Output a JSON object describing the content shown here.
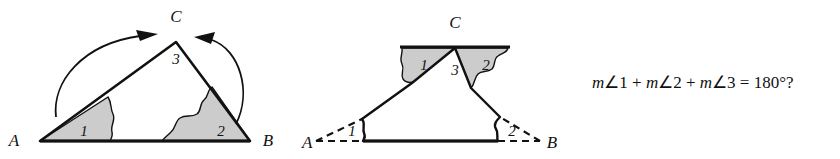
{
  "figure": {
    "kind": "geometry-diagram",
    "topic": "triangle-angle-sum",
    "background_color": "#ffffff",
    "ink_color": "#111111",
    "shade_color": "#cccccc"
  },
  "figure_left": {
    "name": "triangle-with-rotation-arrows",
    "vertices": [
      {
        "id": "A",
        "label": "A"
      },
      {
        "id": "B",
        "label": "B"
      },
      {
        "id": "C",
        "label": "C"
      }
    ],
    "angles": [
      {
        "id": "1",
        "label": "1",
        "at": "A",
        "shaded": true
      },
      {
        "id": "2",
        "label": "2",
        "at": "B",
        "shaded": true
      },
      {
        "id": "3",
        "label": "3",
        "at": "C",
        "shaded": false
      }
    ],
    "arrows": [
      {
        "id": "arrow-left",
        "from": "A",
        "to": "C",
        "direction": "clockwise"
      },
      {
        "id": "arrow-right",
        "from": "B",
        "to": "C",
        "direction": "counterclockwise"
      }
    ]
  },
  "figure_right": {
    "name": "triangle-angles-rearranged-at-vertex",
    "vertices": [
      {
        "id": "A",
        "label": "A"
      },
      {
        "id": "B",
        "label": "B"
      },
      {
        "id": "C",
        "label": "C"
      }
    ],
    "angles_moved": [
      {
        "id": "1",
        "label": "1",
        "shaded": true,
        "position": "left-of-angle-3"
      },
      {
        "id": "2",
        "label": "2",
        "shaded": true,
        "position": "right-of-angle-3"
      }
    ],
    "angles_original": [
      {
        "id": "1",
        "label": "1",
        "at": "A",
        "shaded": false
      },
      {
        "id": "2",
        "label": "2",
        "at": "B",
        "shaded": false
      }
    ],
    "angles_fixed": [
      {
        "id": "3",
        "label": "3",
        "at": "C",
        "shaded": false
      }
    ],
    "straight_line_at_C": true,
    "dashed_edges": [
      "A-corner",
      "B-corner",
      "base-A",
      "base-B"
    ]
  },
  "equation": {
    "m1": "m",
    "angle_symbol": "∠",
    "term1": "1",
    "plus1": "+",
    "m2": "m",
    "term2": "2",
    "plus2": "+",
    "m3": "m",
    "term3": "3",
    "equals": "=",
    "result": "180°?",
    "full_text": "m∠1 + m∠2 + m∠3 = 180°?"
  }
}
